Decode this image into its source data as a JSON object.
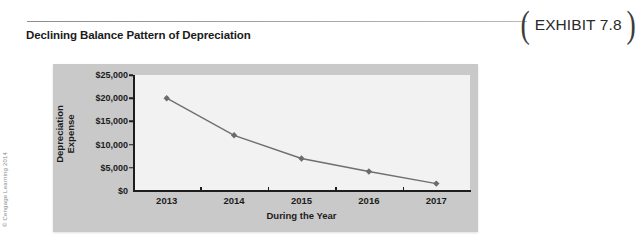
{
  "header": {
    "title": "Declining Balance Pattern of Depreciation",
    "exhibit_label": "EXHIBIT 7.8",
    "paren_left": "(",
    "paren_right": ")"
  },
  "credit": "© Cengage Learning 2014",
  "colors": {
    "panel_bg": "#c9c9c9",
    "plot_bg": "#f2f2f2",
    "axis": "#1d1d1d",
    "series_line": "#6f6f6f",
    "marker": "#6b6b6b",
    "rule": "#8d8d8d"
  },
  "chart_data": {
    "type": "line",
    "title": "Declining Balance Pattern of Depreciation",
    "xlabel": "During the Year",
    "ylabel": "Depreciation Expense",
    "ylabel_lines": [
      "Depreciation",
      "Expense"
    ],
    "categories": [
      "2013",
      "2014",
      "2015",
      "2016",
      "2017"
    ],
    "values": [
      20000,
      12000,
      7000,
      4200,
      1600
    ],
    "series": [
      {
        "name": "Depreciation Expense",
        "values": [
          20000,
          12000,
          7000,
          4200,
          1600
        ]
      }
    ],
    "ylim": [
      0,
      25000
    ],
    "ytick_values": [
      0,
      5000,
      10000,
      15000,
      20000,
      25000
    ],
    "ytick_labels": [
      "$0",
      "$5,000",
      "$10,000",
      "$15,000",
      "$20,000",
      "$25,000"
    ],
    "grid": false,
    "legend": false,
    "marker": "diamond"
  }
}
